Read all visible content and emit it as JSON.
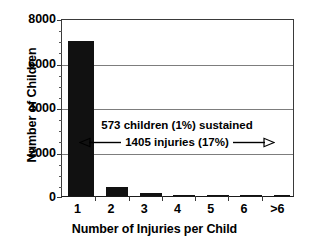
{
  "chart_data": {
    "type": "bar",
    "title": "",
    "xlabel": "Number of Injuries per Child",
    "ylabel": "Number of Children",
    "categories": [
      "1",
      "2",
      "3",
      "4",
      "5",
      "6",
      ">6"
    ],
    "values": [
      7000,
      400,
      150,
      50,
      12,
      6,
      6
    ],
    "ylim": [
      0,
      8000
    ],
    "yticks": [
      0,
      2000,
      4000,
      6000,
      8000
    ],
    "ytick_labels": [
      "0",
      "2000",
      "4000",
      "6000",
      "8000"
    ],
    "grid": "horizontal",
    "legend": "none",
    "bar_color": "#111111",
    "annotations": [
      {
        "line1": "573 children (1%) sustained",
        "line2": "1405 injuries (17%)",
        "left_arrow": "arrow-left",
        "right_arrow": "arrow-right"
      }
    ]
  },
  "axes": {
    "y_title": "Number of Children",
    "x_title": "Number of Injuries per Child",
    "y_ticks": [
      "8000",
      "6000",
      "4000",
      "2000",
      "0"
    ],
    "x_ticks": [
      "1",
      "2",
      "3",
      "4",
      "5",
      "6",
      ">6"
    ]
  },
  "annotation": {
    "line1": "573 children (1%) sustained",
    "line2": "1405 injuries (17%)"
  },
  "colors": {
    "bar": "#111111",
    "grid": "#7d7d7d",
    "axis": "#3a3a3a",
    "text": "#000000",
    "background": "#ffffff"
  }
}
